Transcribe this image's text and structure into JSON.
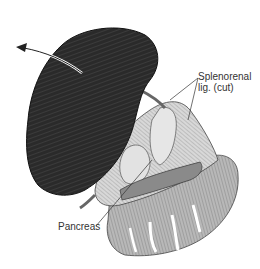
{
  "figure": {
    "labels": {
      "splenorenal_line1": "Splenorenal",
      "splenorenal_line2": "lig. (cut)",
      "pancreas": "Pancreas"
    },
    "colors": {
      "spleen": "#2b2b2b",
      "line": "#333333",
      "tissue": "#9a9a9a",
      "background": "#ffffff"
    }
  }
}
